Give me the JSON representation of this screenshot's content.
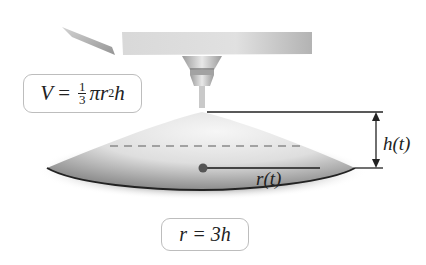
{
  "diagram": {
    "formulas": {
      "volume": {
        "lhs": "V",
        "equals": "=",
        "fraction_numerator": "1",
        "fraction_denominator": "3",
        "rhs_pi": "π",
        "rhs_r": "r",
        "rhs_exponent": "2",
        "rhs_h": "h"
      },
      "ratio": {
        "text": "r = 3h"
      }
    },
    "labels": {
      "height": "h(t)",
      "radius": "r(t)"
    },
    "colors": {
      "line": "#222222",
      "box_border": "#bdbdbd",
      "shading_dark": "#5a5a5a",
      "shading_light": "#eeeeee"
    }
  }
}
